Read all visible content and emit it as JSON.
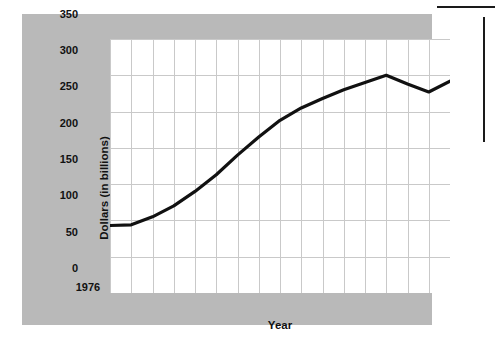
{
  "chart_data": {
    "type": "line",
    "title": "",
    "xlabel": "Year",
    "ylabel": "Dollars (in billions)",
    "xlim": [
      1976,
      1992
    ],
    "ylim": [
      0,
      350
    ],
    "grid": true,
    "legend": "none",
    "y_ticks": [
      350,
      300,
      250,
      200,
      150,
      100,
      50,
      0
    ],
    "x_ticks": [
      1976,
      1978,
      1980,
      1982,
      1984,
      1986,
      1988,
      1990,
      1992
    ],
    "x_gridline_years": [
      1976,
      1977,
      1978,
      1979,
      1980,
      1981,
      1982,
      1983,
      1984,
      1985,
      1986,
      1987,
      1988,
      1989,
      1990,
      1991,
      1992
    ],
    "x": [
      1976,
      1977,
      1978,
      1979,
      1980,
      1981,
      1982,
      1983,
      1984,
      1985,
      1986,
      1987,
      1988,
      1989,
      1990,
      1991,
      1992
    ],
    "values": [
      93,
      94,
      105,
      120,
      140,
      163,
      190,
      215,
      238,
      255,
      268,
      280,
      290,
      300,
      288,
      277,
      292
    ],
    "series": [
      {
        "name": "Dollars (in billions)",
        "color": "#111111",
        "values": [
          93,
          94,
          105,
          120,
          140,
          163,
          190,
          215,
          238,
          255,
          268,
          280,
          290,
          300,
          288,
          277,
          292
        ]
      }
    ],
    "annotations": []
  },
  "style": {
    "panel_color": "#b9b9b9",
    "plot_background": "#ffffff",
    "gridline_color": "#c9c9c9",
    "line_color": "#111111",
    "text_color": "#111111"
  }
}
